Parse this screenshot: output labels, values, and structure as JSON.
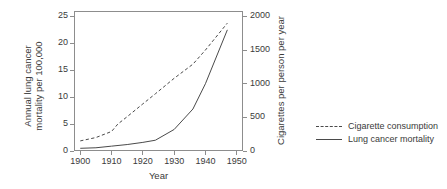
{
  "chart_data": {
    "type": "line",
    "title": "",
    "xlabel": "Year",
    "ylabel": "Annual lung cancer mortality per 100,000",
    "ylabel_line1": "Annual lung cancer",
    "ylabel_line2": "mortality per 100,000",
    "ylabel_right": "Cigarettes per person per year",
    "xlim": [
      1898,
      1952
    ],
    "ylim": [
      0,
      26
    ],
    "ylim_right": [
      0,
      2080
    ],
    "xticks": [
      1900,
      1910,
      1920,
      1930,
      1940,
      1950
    ],
    "xtick_labels": [
      "1900",
      "1910",
      "1920",
      "1930",
      "1940",
      "1950"
    ],
    "yticks": [
      0,
      5,
      10,
      15,
      20,
      25
    ],
    "ytick_labels": [
      "0",
      "5",
      "10",
      "15",
      "20",
      "25"
    ],
    "yticks_right": [
      0,
      500,
      1000,
      1500,
      2000
    ],
    "ytick_labels_right": [
      "0",
      "500",
      "1000",
      "1500",
      "2000"
    ],
    "grid": false,
    "legend_position": "right",
    "series": [
      {
        "name": "Cigarette consumption",
        "axis": "right",
        "style": "dashed",
        "color": "#4a4a4a",
        "x": [
          1900,
          1905,
          1910,
          1912,
          1915,
          1920,
          1924,
          1930,
          1936,
          1940,
          1947
        ],
        "values": [
          150,
          200,
          290,
          400,
          510,
          700,
          850,
          1080,
          1290,
          1500,
          1900
        ]
      },
      {
        "name": "Lung cancer mortality",
        "axis": "left",
        "style": "solid",
        "color": "#4a4a4a",
        "x": [
          1900,
          1905,
          1910,
          1915,
          1920,
          1924,
          1930,
          1936,
          1940,
          1947
        ],
        "values": [
          0.5,
          0.6,
          0.9,
          1.2,
          1.6,
          2.0,
          4.0,
          7.8,
          12.5,
          22.5
        ]
      }
    ]
  },
  "legend": {
    "items": [
      {
        "label": "Cigarette consumption",
        "style": "dashed"
      },
      {
        "label": "Lung cancer mortality",
        "style": "solid"
      }
    ]
  }
}
